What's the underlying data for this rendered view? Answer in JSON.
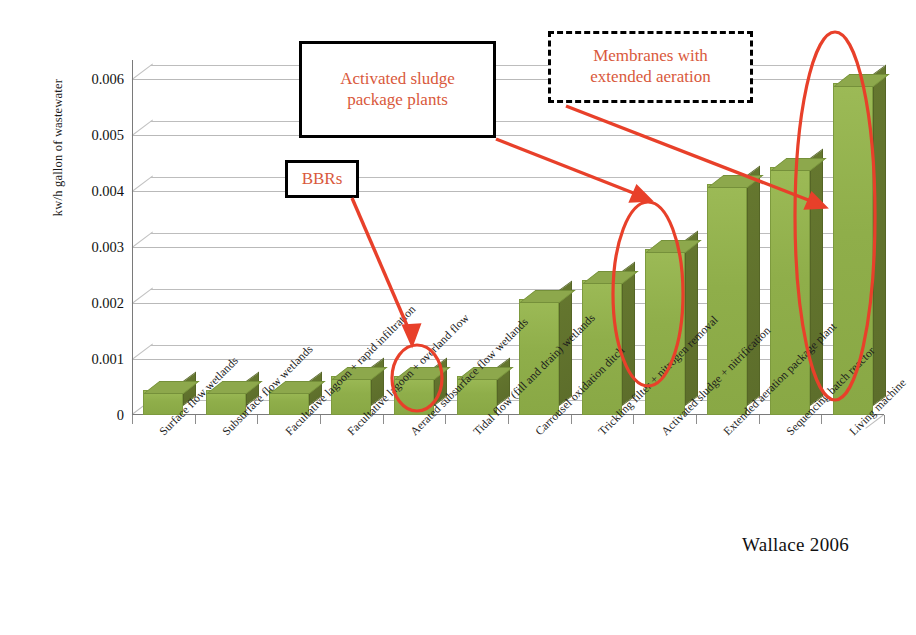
{
  "chart_data": {
    "type": "bar",
    "title": "",
    "xlabel": "",
    "ylabel": "kw/h gallon of wastewater",
    "ylim": [
      0,
      0.0063
    ],
    "ytick_labels": [
      "0",
      "0.001",
      "0.002",
      "0.003",
      "0.004",
      "0.005",
      "0.006"
    ],
    "ytick_values": [
      0,
      0.001,
      0.002,
      0.003,
      0.004,
      0.005,
      0.006
    ],
    "grid": true,
    "legend": "none",
    "style": "3d-column",
    "bar_color": "#8fae4a",
    "bar_side_color": "#5d6e2b",
    "categories": [
      "Surface flow wetlands",
      "Subsurface flow wetlands",
      "Facultative lagoon + rapid infiltration",
      "Facultative lagoon + overland flow",
      "Aerated subsurface flow wetlands",
      "Tidal flow (fill and drain) wetlands",
      "Carrousel oxidation ditch",
      "Trickling filter + nitrogen removal",
      "Activated sludge + nitrification",
      "Extended aeration package plant",
      "Sequencing batch reactor",
      "Living machine"
    ],
    "values": [
      0.00045,
      0.00045,
      0.00045,
      0.0007,
      0.0007,
      0.0007,
      0.00205,
      0.0024,
      0.00295,
      0.0041,
      0.0044,
      0.0059
    ],
    "source": "Wallace 2006"
  },
  "annotations": [
    {
      "id": "activated-sludge",
      "text_line1": "Activated sludge",
      "text_line2": "package plants",
      "border": "solid",
      "color": "#d9593c"
    },
    {
      "id": "membranes",
      "text_line1": "Membranes with",
      "text_line2": "extended aeration",
      "border": "dashed",
      "color": "#d9593c"
    },
    {
      "id": "bbrs",
      "text_line1": "BBRs",
      "text_line2": "",
      "border": "solid",
      "color": "#d9593c"
    }
  ],
  "highlight_color": "#e8402a",
  "source_label": "Wallace 2006"
}
